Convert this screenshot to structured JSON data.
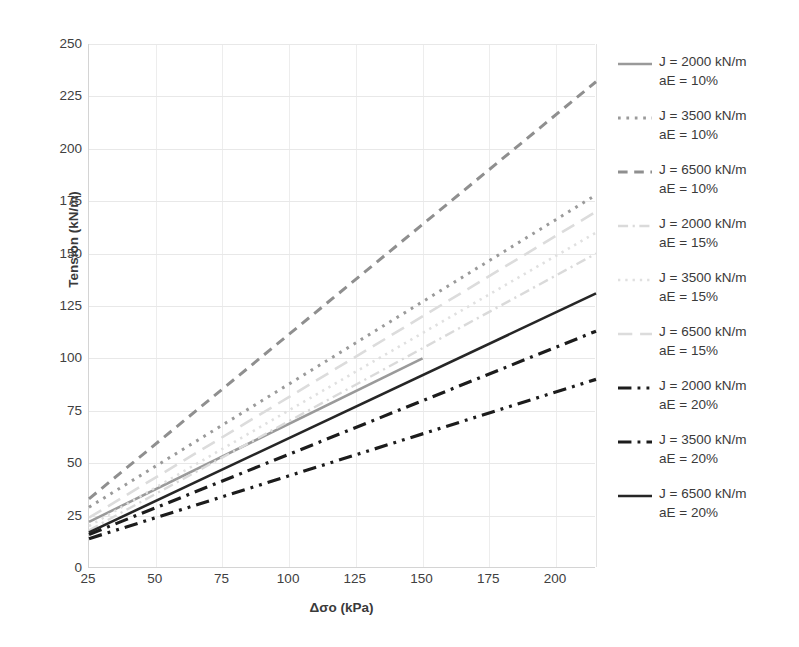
{
  "chart_data": {
    "type": "line",
    "title": "",
    "xlabel": "Δσo (kPa)",
    "ylabel": "Tension (kN/m)",
    "xlim": [
      25,
      215
    ],
    "ylim": [
      0,
      250
    ],
    "xticks": [
      25,
      50,
      75,
      100,
      125,
      150,
      175,
      200
    ],
    "yticks": [
      0,
      25,
      50,
      75,
      100,
      125,
      150,
      175,
      200,
      225,
      250
    ],
    "grid": true,
    "legend_position": "right",
    "series": [
      {
        "name": "J = 2000 kN/m aE = 10%",
        "label_line1": "J = 2000 kN/m",
        "label_line2": "aE = 10%",
        "style": "solid",
        "color": "#9a9a9a",
        "width": 2.6,
        "x": [
          25,
          150
        ],
        "values": [
          22,
          100
        ]
      },
      {
        "name": "J = 3500 kN/m aE = 10%",
        "label_line1": "J = 3500 kN/m",
        "label_line2": "aE = 10%",
        "style": "dotted",
        "color": "#9a9a9a",
        "width": 3.0,
        "x": [
          25,
          215
        ],
        "values": [
          29,
          178
        ]
      },
      {
        "name": "J = 6500 kN/m aE = 10%",
        "label_line1": "J = 6500 kN/m",
        "label_line2": "aE = 10%",
        "style": "dashed",
        "color": "#8f8f8f",
        "width": 3.0,
        "x": [
          25,
          215
        ],
        "values": [
          33,
          232
        ]
      },
      {
        "name": "J = 2000 kN/m aE = 15%",
        "label_line1": "J = 2000 kN/m",
        "label_line2": "aE = 15%",
        "style": "dashdot",
        "color": "#dadada",
        "width": 2.4,
        "x": [
          25,
          215
        ],
        "values": [
          18,
          150
        ]
      },
      {
        "name": "J = 3500 kN/m aE = 15%",
        "label_line1": "J = 3500 kN/m",
        "label_line2": "aE = 15%",
        "style": "dotted",
        "color": "#e0e0e0",
        "width": 2.6,
        "x": [
          25,
          215
        ],
        "values": [
          20,
          160
        ]
      },
      {
        "name": "J = 6500 kN/m aE = 15%",
        "label_line1": "J = 6500 kN/m",
        "label_line2": "aE = 15%",
        "style": "longdash",
        "color": "#dcdcdc",
        "width": 2.6,
        "x": [
          25,
          215
        ],
        "values": [
          24,
          170
        ]
      },
      {
        "name": "J = 2000 kN/m aE = 20%",
        "label_line1": "J = 2000 kN/m",
        "label_line2": "aE = 20%",
        "style": "dashdotdot",
        "color": "#1c1c1c",
        "width": 3.2,
        "x": [
          25,
          215
        ],
        "values": [
          14,
          90
        ]
      },
      {
        "name": "J = 3500 kN/m aE = 20%",
        "label_line1": "J = 3500 kN/m",
        "label_line2": "aE = 20%",
        "style": "dashdot",
        "color": "#1c1c1c",
        "width": 3.2,
        "x": [
          25,
          215
        ],
        "values": [
          16,
          113
        ]
      },
      {
        "name": "J = 6500 kN/m aE = 20%",
        "label_line1": "J = 6500 kN/m",
        "label_line2": "aE = 20%",
        "style": "solid",
        "color": "#262626",
        "width": 2.6,
        "x": [
          25,
          215
        ],
        "values": [
          17,
          131
        ]
      }
    ]
  }
}
